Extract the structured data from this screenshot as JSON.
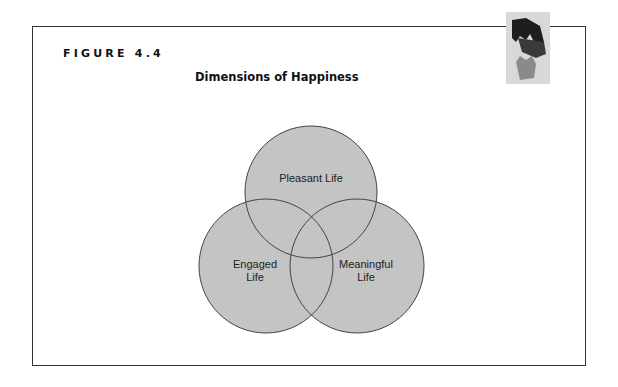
{
  "figure": {
    "label": "FIGURE 4.4",
    "title": "Dimensions of Happiness"
  },
  "diagram": {
    "type": "venn",
    "fill_color": "#c4c4c4",
    "stroke_color": "#444444",
    "circles": [
      {
        "name": "pleasant",
        "label_lines": [
          "Pleasant Life"
        ],
        "cx": 311,
        "cy": 192,
        "r": 66
      },
      {
        "name": "engaged",
        "label_lines": [
          "Engaged",
          "Life"
        ],
        "cx": 266,
        "cy": 266,
        "r": 67
      },
      {
        "name": "meaningful",
        "label_lines": [
          "Meaningful",
          "Life"
        ],
        "cx": 357,
        "cy": 266,
        "r": 67
      }
    ]
  },
  "logo": {
    "icon": "hands-icon"
  }
}
